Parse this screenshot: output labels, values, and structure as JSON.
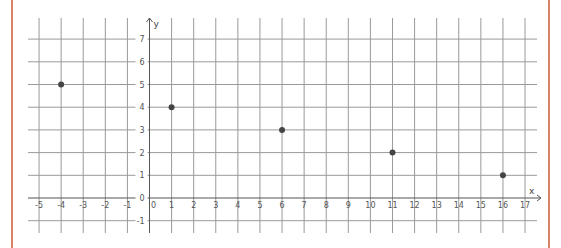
{
  "chart_data": {
    "type": "scatter",
    "title": "",
    "xlabel": "x",
    "ylabel": "y",
    "xlim": [
      -5,
      17
    ],
    "ylim": [
      -1,
      7
    ],
    "grid": true,
    "x_ticks": [
      -5,
      -4,
      -3,
      -2,
      -1,
      0,
      1,
      2,
      3,
      4,
      5,
      6,
      7,
      8,
      9,
      10,
      11,
      12,
      13,
      14,
      15,
      16,
      17
    ],
    "y_ticks": [
      -1,
      0,
      1,
      2,
      3,
      4,
      5,
      6,
      7
    ],
    "points": [
      {
        "x": -4,
        "y": 5
      },
      {
        "x": 1,
        "y": 4
      },
      {
        "x": 6,
        "y": 3
      },
      {
        "x": 11,
        "y": 2
      },
      {
        "x": 16,
        "y": 1
      }
    ],
    "colors": {
      "grid": "#9a9a9a",
      "axis": "#555555",
      "point": "#444444",
      "frame": "#d9826a"
    }
  }
}
